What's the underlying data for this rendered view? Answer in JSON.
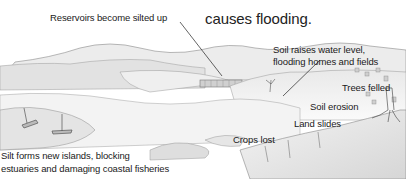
{
  "heading": {
    "partial_line": "",
    "line": "causes flooding."
  },
  "labels": {
    "reservoirs": "Reservoirs become silted up",
    "soil_water_1": "Soil raises water level,",
    "soil_water_2": "flooding homes and fields",
    "trees_felled": "Trees felled",
    "soil_erosion": "Soil erosion",
    "land_slides": "Land slides",
    "crops_lost": "Crops lost",
    "silt_1": "Silt forms new islands, blocking",
    "silt_2": "estuaries and damaging coastal fisheries"
  }
}
